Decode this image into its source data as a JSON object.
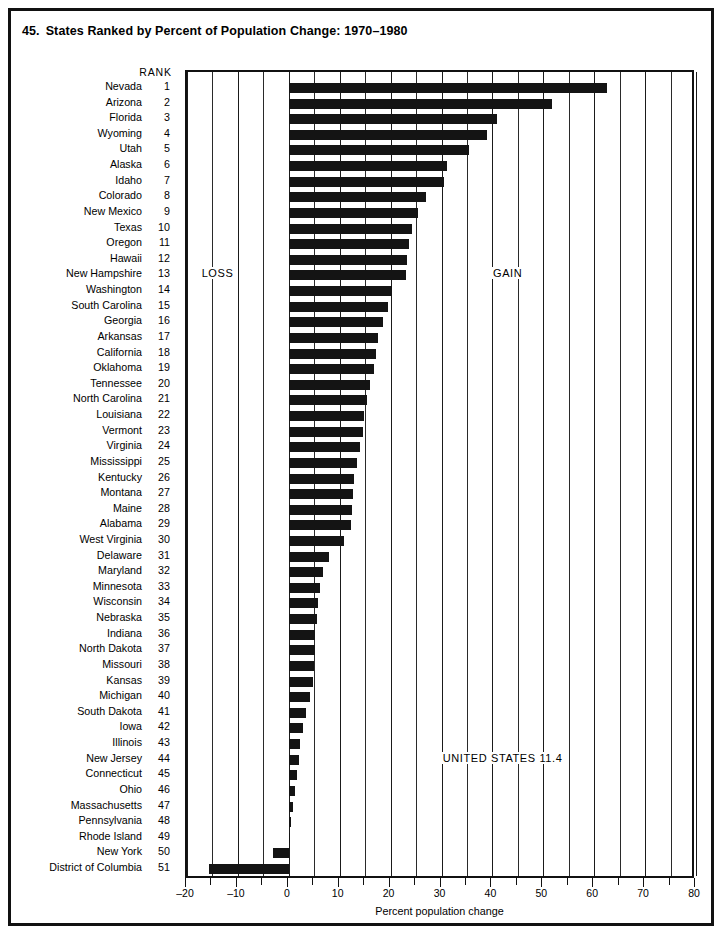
{
  "figure": {
    "number": "45.",
    "title": "States Ranked by Percent of Population Change: 1970–1980",
    "rank_header": "RANK",
    "loss_label": "LOSS",
    "gain_label": "GAIN",
    "us_label": "UNITED STATES 11.4",
    "bar_color": "#141414",
    "frame_color": "#111111"
  },
  "chart_data": {
    "type": "bar",
    "orientation": "horizontal",
    "xlabel": "Percent population change",
    "ylabel": "",
    "xlim": [
      -20,
      80
    ],
    "xticks": [
      -20,
      -10,
      0,
      10,
      20,
      30,
      40,
      50,
      60,
      70,
      80
    ],
    "xticklabels": [
      "–20",
      "–10",
      "0",
      "10",
      "20",
      "30",
      "40",
      "50",
      "60",
      "70",
      "80"
    ],
    "minor_tick_step": 5,
    "grid": "vertical",
    "legend": "none",
    "annotations": [
      {
        "text": "LOSS",
        "x": -14,
        "rank": 13
      },
      {
        "text": "GAIN",
        "x": 43,
        "rank": 13
      },
      {
        "text": "UNITED STATES 11.4",
        "x": 42,
        "rank": 44
      }
    ],
    "categories": [
      "Nevada",
      "Arizona",
      "Florida",
      "Wyoming",
      "Utah",
      "Alaska",
      "Idaho",
      "Colorado",
      "New Mexico",
      "Texas",
      "Oregon",
      "Hawaii",
      "New Hampshire",
      "Washington",
      "South Carolina",
      "Georgia",
      "Arkansas",
      "California",
      "Oklahoma",
      "Tennessee",
      "North Carolina",
      "Louisiana",
      "Vermont",
      "Virginia",
      "Mississippi",
      "Kentucky",
      "Montana",
      "Maine",
      "Alabama",
      "West Virginia",
      "Delaware",
      "Maryland",
      "Minnesota",
      "Wisconsin",
      "Nebraska",
      "Indiana",
      "North Dakota",
      "Missouri",
      "Kansas",
      "Michigan",
      "South Dakota",
      "Iowa",
      "Illinois",
      "New Jersey",
      "Connecticut",
      "Ohio",
      "Massachusetts",
      "Pennsylvania",
      "Rhode Island",
      "New York",
      "District of Columbia"
    ],
    "ranks": [
      1,
      2,
      3,
      4,
      5,
      6,
      7,
      8,
      9,
      10,
      11,
      12,
      13,
      14,
      15,
      16,
      17,
      18,
      19,
      20,
      21,
      22,
      23,
      24,
      25,
      26,
      27,
      28,
      29,
      30,
      31,
      32,
      33,
      34,
      35,
      36,
      37,
      38,
      39,
      40,
      41,
      42,
      43,
      44,
      45,
      46,
      47,
      48,
      49,
      50,
      51
    ],
    "values": [
      62.5,
      51.8,
      40.9,
      38.9,
      35.4,
      31.0,
      30.5,
      27.0,
      25.4,
      24.3,
      23.7,
      23.3,
      23.0,
      20.3,
      19.4,
      18.6,
      17.6,
      17.1,
      16.8,
      15.9,
      15.3,
      14.8,
      14.5,
      13.9,
      13.4,
      12.9,
      12.7,
      12.5,
      12.2,
      10.9,
      7.9,
      6.7,
      6.2,
      5.7,
      5.5,
      5.2,
      5.1,
      4.9,
      4.7,
      4.2,
      3.4,
      2.7,
      2.2,
      2.0,
      1.7,
      1.2,
      0.8,
      0.5,
      0.3,
      -3.2,
      -15.7
    ]
  }
}
